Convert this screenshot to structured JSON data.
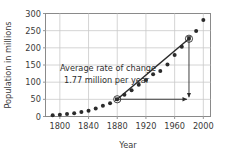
{
  "chart_data": {
    "type": "scatter",
    "title": "",
    "xlabel": "Year",
    "ylabel": "Population in millions",
    "xlim": [
      1780,
      2010
    ],
    "ylim": [
      0,
      300
    ],
    "xticks": [
      1800,
      1840,
      1880,
      1920,
      1960,
      2000
    ],
    "yticks": [
      0,
      50,
      100,
      150,
      200,
      250,
      300
    ],
    "grid": true,
    "legend": "none",
    "series": [
      {
        "name": "US population",
        "marker": "circle",
        "color": "#2b2b2b",
        "x": [
          1790,
          1800,
          1810,
          1820,
          1830,
          1840,
          1850,
          1860,
          1870,
          1880,
          1890,
          1900,
          1910,
          1920,
          1930,
          1940,
          1950,
          1960,
          1970,
          1980,
          1990,
          2000
        ],
        "y": [
          3.9,
          5.3,
          7.2,
          9.6,
          12.9,
          17.1,
          23.2,
          31.4,
          38.6,
          50.2,
          63.0,
          76.2,
          92.2,
          106.0,
          123.2,
          132.2,
          151.3,
          179.3,
          203.3,
          226.5,
          248.7,
          281.4
        ]
      }
    ],
    "annotations": [
      {
        "name": "rate-of-change-note",
        "line1": "Average rate of change",
        "line2": "1.77 million per year",
        "x": 1845,
        "y": 160
      },
      {
        "name": "secant-line",
        "from": {
          "x": 1880,
          "y": 50.2
        },
        "to": {
          "x": 1980,
          "y": 226.5
        },
        "style": "solid",
        "color": "#2b2b2b"
      },
      {
        "name": "highlight-marker-start",
        "x": 1880,
        "y": 50.2,
        "style": "open-circle"
      },
      {
        "name": "highlight-marker-end",
        "x": 1980,
        "y": 226.5,
        "style": "open-circle"
      },
      {
        "name": "run-arrow",
        "from": {
          "x": 1880,
          "y": 50.2
        },
        "to": {
          "x": 1980,
          "y": 50.2
        },
        "style": "double-arrow"
      },
      {
        "name": "rise-arrow",
        "from": {
          "x": 1980,
          "y": 226.5
        },
        "to": {
          "x": 1980,
          "y": 50.2
        },
        "style": "double-arrow"
      }
    ]
  },
  "axes": {
    "ylabel": "Population in millions",
    "xlabel": "Year",
    "xtick_labels": [
      "1800",
      "1840",
      "1880",
      "1920",
      "1960",
      "2000"
    ],
    "ytick_labels": [
      "0",
      "50",
      "100",
      "150",
      "200",
      "250",
      "300"
    ]
  },
  "annotation": {
    "line1": "Average rate of change",
    "line2": "1.77 million per year"
  },
  "colors": {
    "marker": "#2b2b2b",
    "grid": "#c9c9c9",
    "frame": "#8a8a8a",
    "text": "#3a3a3a",
    "background": "#ffffff"
  }
}
